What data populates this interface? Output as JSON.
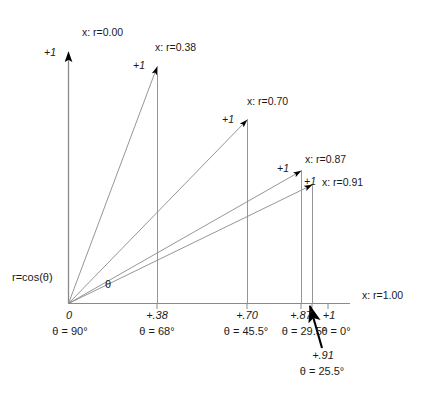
{
  "figure": {
    "axis": {
      "y_tip_label": "+1",
      "x_axis_name": "x: r=1.00",
      "y_axis_name": "x: r=0.00",
      "origin_label": "r=cos(θ)",
      "angle_symbol": "θ"
    },
    "vectors": [
      {
        "id": "v-000",
        "r_label": "x: r=0.00",
        "tip_label": "+1",
        "x_value": "0",
        "angle": "θ = 90°",
        "r": 0.0,
        "theta_deg": 90
      },
      {
        "id": "v-038",
        "r_label": "x: r=0.38",
        "tip_label": "+1",
        "x_value": "+.38",
        "angle": "θ = 68°",
        "r": 0.38,
        "theta_deg": 68
      },
      {
        "id": "v-070",
        "r_label": "x: r=0.70",
        "tip_label": "+1",
        "x_value": "+.70",
        "angle": "θ = 45.5°",
        "r": 0.7,
        "theta_deg": 45.5
      },
      {
        "id": "v-087",
        "r_label": "x: r=0.87",
        "tip_label": "+1",
        "x_value": "+.87",
        "angle": "θ = 29.5°",
        "r": 0.87,
        "theta_deg": 29.5
      },
      {
        "id": "v-091",
        "r_label": "x: r=0.91",
        "tip_label": "+1",
        "x_value": "+.91",
        "angle": "θ = 25.5°",
        "r": 0.91,
        "theta_deg": 25.5
      },
      {
        "id": "v-100",
        "r_label": "x: r=1.00",
        "tip_label": "+1",
        "x_value": "+1",
        "angle": "θ = 0°",
        "r": 1.0,
        "theta_deg": 0
      }
    ],
    "colors": {
      "line": "#7a7a7a",
      "text": "#1a1a1a",
      "arrowhead": "#000000"
    }
  }
}
